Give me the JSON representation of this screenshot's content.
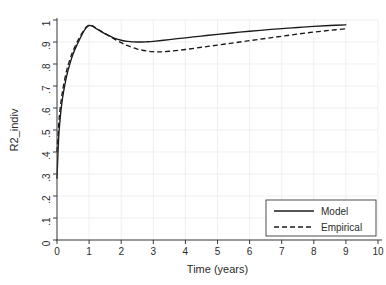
{
  "chart_data": {
    "type": "line",
    "title": "",
    "xlabel": "Time (years)",
    "ylabel": "R2_indiv",
    "xlim": [
      0,
      10
    ],
    "ylim": [
      0,
      1
    ],
    "grid": true,
    "legend_position": "lower right",
    "xticks": [
      "0",
      "1",
      "2",
      "3",
      "4",
      "5",
      "6",
      "7",
      "8",
      "9",
      "10"
    ],
    "xtick_values": [
      0,
      1,
      2,
      3,
      4,
      5,
      6,
      7,
      8,
      9,
      10
    ],
    "yticks": [
      "0",
      ".1",
      ".2",
      ".3",
      ".4",
      ".5",
      ".6",
      ".7",
      ".8",
      ".9",
      "1"
    ],
    "ytick_values": [
      0,
      0.1,
      0.2,
      0.3,
      0.4,
      0.5,
      0.6,
      0.7,
      0.8,
      0.9,
      1
    ],
    "series": [
      {
        "name": "Model",
        "style": "solid",
        "color": "#1a1a1a",
        "x": [
          0.0,
          0.05,
          0.1,
          0.15,
          0.2,
          0.3,
          0.4,
          0.5,
          0.6,
          0.7,
          0.8,
          0.9,
          1.0,
          1.1,
          1.2,
          1.4,
          1.6,
          1.8,
          2.0,
          2.2,
          2.5,
          2.8,
          3.0,
          3.5,
          4.0,
          4.5,
          5.0,
          5.5,
          6.0,
          6.5,
          7.0,
          7.5,
          8.0,
          8.5,
          9.0
        ],
        "y": [
          0.28,
          0.46,
          0.555,
          0.62,
          0.67,
          0.745,
          0.8,
          0.845,
          0.88,
          0.91,
          0.94,
          0.963,
          0.975,
          0.972,
          0.963,
          0.945,
          0.93,
          0.917,
          0.908,
          0.903,
          0.9,
          0.901,
          0.903,
          0.911,
          0.919,
          0.927,
          0.935,
          0.942,
          0.949,
          0.955,
          0.961,
          0.966,
          0.971,
          0.975,
          0.978
        ]
      },
      {
        "name": "Empirical",
        "style": "dashed",
        "color": "#1a1a1a",
        "x": [
          0.0,
          0.05,
          0.1,
          0.15,
          0.2,
          0.3,
          0.4,
          0.5,
          0.6,
          0.7,
          0.8,
          0.9,
          1.0,
          1.1,
          1.2,
          1.4,
          1.6,
          1.8,
          2.0,
          2.2,
          2.5,
          2.8,
          3.0,
          3.2,
          3.5,
          4.0,
          4.5,
          5.0,
          5.5,
          6.0,
          6.5,
          7.0,
          7.5,
          8.0,
          8.5,
          9.0
        ],
        "y": [
          0.4,
          0.52,
          0.6,
          0.655,
          0.7,
          0.77,
          0.82,
          0.86,
          0.892,
          0.92,
          0.945,
          0.966,
          0.977,
          0.974,
          0.965,
          0.947,
          0.929,
          0.912,
          0.897,
          0.883,
          0.868,
          0.859,
          0.856,
          0.855,
          0.858,
          0.866,
          0.876,
          0.886,
          0.896,
          0.906,
          0.916,
          0.926,
          0.936,
          0.945,
          0.953,
          0.96
        ]
      }
    ],
    "annotations": []
  },
  "legend": {
    "items": [
      {
        "label": "Model",
        "style": "solid"
      },
      {
        "label": "Empirical",
        "style": "dashed"
      }
    ]
  },
  "colors": {
    "background": "#ffffff",
    "axis": "#3a3a3a",
    "grid": "#e9e9e9",
    "line": "#1a1a1a"
  }
}
